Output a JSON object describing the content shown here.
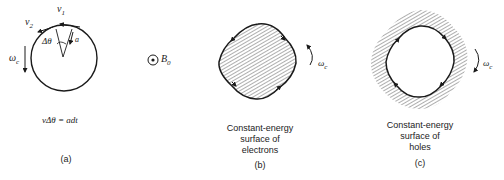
{
  "panel_a": {
    "v1": "v",
    "v1_sub": "1",
    "v2": "v",
    "v2_sub": "2",
    "delta_theta": "Δθ",
    "a": "a",
    "omega": "ω",
    "omega_sub": "c",
    "equation": "vΔθ = adt",
    "caption": "(a)"
  },
  "field": {
    "symbol": "B",
    "symbol_sub": "0"
  },
  "panel_b": {
    "caption_line1": "Constant-energy",
    "caption_line2": "surface of",
    "caption_line3": "electrons",
    "label": "(b)",
    "omega": "ω",
    "omega_sub": "c"
  },
  "panel_c": {
    "caption_line1": "Constant-energy",
    "caption_line2": "surface of",
    "caption_line3": "holes",
    "label": "(c)",
    "omega": "ω",
    "omega_sub": "c"
  },
  "colors": {
    "ink": "#1a1a1a",
    "hatch": "#333333",
    "background": "#ffffff"
  }
}
